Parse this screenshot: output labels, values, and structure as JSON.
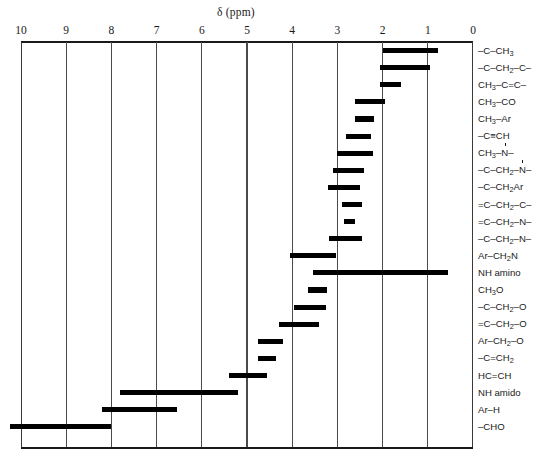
{
  "chart_data": {
    "type": "bar",
    "orientation": "horizontal-ranges",
    "title": "δ (ppm)",
    "xlabel": "δ (ppm)",
    "ylabel": "",
    "xlim": [
      10,
      0
    ],
    "axis_reversed": true,
    "grid": true,
    "legend": "none",
    "tick_labels": [
      "10",
      "9",
      "8",
      "7",
      "6",
      "5",
      "4",
      "3",
      "2",
      "1",
      "0"
    ],
    "tick_values": [
      10,
      9,
      8,
      7,
      6,
      5,
      4,
      3,
      2,
      1,
      0
    ],
    "categories": [
      "–C–CH3",
      "–C–CH2–C–",
      "CH3–C=C–",
      "CH3–CO",
      "CH3–Ar",
      "–C≡CH",
      "CH3–N–",
      "–C–CH2–N–",
      "–C–CH2Ar",
      "=C–CH2–C–",
      "=C–CH2–N–",
      "–C–CH2–N–",
      "Ar–CH2N",
      "NH amino",
      "CH3O",
      "–C–CH2–O",
      "=C–CH2–O",
      "Ar–CH2–O",
      "–C=CH2",
      "HC=CH",
      "NH amido",
      "Ar–H",
      "–CHO"
    ],
    "ranges": [
      [
        2.0,
        0.77
      ],
      [
        2.05,
        0.95
      ],
      [
        2.05,
        1.6
      ],
      [
        2.62,
        1.95
      ],
      [
        2.6,
        2.18
      ],
      [
        2.8,
        2.25
      ],
      [
        3.0,
        2.22
      ],
      [
        3.1,
        2.42
      ],
      [
        3.2,
        2.5
      ],
      [
        2.9,
        2.45
      ],
      [
        2.85,
        2.6
      ],
      [
        3.18,
        2.45
      ],
      [
        4.05,
        3.02
      ],
      [
        3.55,
        0.55
      ],
      [
        3.65,
        3.23
      ],
      [
        3.95,
        3.25
      ],
      [
        4.3,
        3.4
      ],
      [
        4.75,
        4.2
      ],
      [
        4.75,
        4.35
      ],
      [
        5.4,
        4.55
      ],
      [
        7.8,
        5.2
      ],
      [
        8.2,
        6.55
      ],
      [
        10.25,
        8.0
      ]
    ]
  },
  "rows": [
    {
      "id": "c-ch3",
      "low": 0.77,
      "high": 2.0,
      "html": "–C–CH<sub>3</sub>"
    },
    {
      "id": "c-ch2-c",
      "low": 0.95,
      "high": 2.05,
      "html": "–C–CH<sub>2</sub>–C–"
    },
    {
      "id": "ch3-c-dbl-c",
      "low": 1.6,
      "high": 2.05,
      "html": "CH<sub>3</sub>–C=C–"
    },
    {
      "id": "ch3-co",
      "low": 1.95,
      "high": 2.62,
      "html": "CH<sub>3</sub>–CO"
    },
    {
      "id": "ch3-ar",
      "low": 2.18,
      "high": 2.6,
      "html": "CH<sub>3</sub>–Ar"
    },
    {
      "id": "c-triple-ch",
      "low": 2.25,
      "high": 2.8,
      "html": "–C≡CH"
    },
    {
      "id": "ch3-n",
      "low": 2.22,
      "high": 3.0,
      "html": "CH<sub>3</sub>–<span class=\"nlink\">N</span>–"
    },
    {
      "id": "c-ch2-n",
      "low": 2.42,
      "high": 3.1,
      "html": "–C–CH<sub>2</sub>–<span class=\"nlink\">N</span>–"
    },
    {
      "id": "c-ch2-ar",
      "low": 2.5,
      "high": 3.2,
      "html": "–C–CH<sub>2</sub>Ar"
    },
    {
      "id": "dblc-ch2-c",
      "low": 2.45,
      "high": 2.9,
      "html": "=C–CH<sub>2</sub>–C–"
    },
    {
      "id": "dblc-ch2-n",
      "low": 2.6,
      "high": 2.85,
      "html": "=C–CH<sub>2</sub>–N–"
    },
    {
      "id": "c-ch2-n2",
      "low": 2.45,
      "high": 3.18,
      "html": "–C–CH<sub>2</sub>–N–"
    },
    {
      "id": "ar-ch2n",
      "low": 3.02,
      "high": 4.05,
      "html": "Ar–CH<sub>2</sub>N"
    },
    {
      "id": "nh-amino",
      "low": 0.55,
      "high": 3.55,
      "html": "NH amino"
    },
    {
      "id": "ch3o",
      "low": 3.23,
      "high": 3.65,
      "html": "CH<sub>3</sub>O"
    },
    {
      "id": "c-ch2-o",
      "low": 3.25,
      "high": 3.95,
      "html": "–C–CH<sub>2</sub>–O"
    },
    {
      "id": "dblc-ch2-o",
      "low": 3.4,
      "high": 4.3,
      "html": "=C–CH<sub>2</sub>–O"
    },
    {
      "id": "ar-ch2-o",
      "low": 4.2,
      "high": 4.75,
      "html": "Ar–CH<sub>2</sub>–O"
    },
    {
      "id": "c-dbl-ch2",
      "low": 4.35,
      "high": 4.75,
      "html": "–C=CH<sub>2</sub>"
    },
    {
      "id": "hc-dbl-ch",
      "low": 4.55,
      "high": 5.4,
      "html": "HC=CH"
    },
    {
      "id": "nh-amido",
      "low": 5.2,
      "high": 7.8,
      "html": "NH amido"
    },
    {
      "id": "ar-h",
      "low": 6.55,
      "high": 8.2,
      "html": "Ar–H"
    },
    {
      "id": "cho",
      "low": 8.0,
      "high": 10.25,
      "html": "–CHO"
    }
  ],
  "colors": {
    "bar": "#000000",
    "grid": "#4a4a4a",
    "axis": "#1a1a1a",
    "background": "#ffffff"
  }
}
